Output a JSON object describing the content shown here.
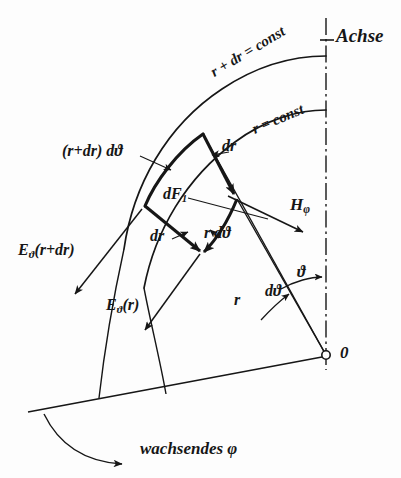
{
  "figure": {
    "kind": "hand-drawn technical diagram",
    "language": "German",
    "ink_color": "#161616",
    "background_color": "#fdfdfd"
  },
  "labels": {
    "axis": "Achse",
    "outer_arc": "r + dr = const",
    "inner_arc": "r = const",
    "outer_tangential_edge": "(r+dr) dϑ",
    "inner_tangential_edge": "r dϑ",
    "radial_edge_top": "dr",
    "radial_edge_bottom": "dr",
    "area_element": "dF",
    "area_element_subscript": "1",
    "field_outer": "E",
    "field_outer_subscript": "ϑ",
    "field_outer_arg": "(r+dr)",
    "field_inner": "E",
    "field_inner_subscript": "ϑ",
    "field_inner_arg": "(r)",
    "magnetic": "H",
    "magnetic_subscript": "φ",
    "radius": "r",
    "angle": "ϑ",
    "angle_increment": "dϑ",
    "origin": "0",
    "growing_phi": "wachsendes φ"
  },
  "geometry": {
    "origin_x": 326,
    "origin_y": 355,
    "inner_radius": 196,
    "outer_radius": 238,
    "element_corner_top": [
      203,
      134
    ],
    "element_corner_left": [
      145,
      206
    ],
    "element_corner_bottom": [
      203,
      253
    ],
    "element_corner_right": [
      237,
      199
    ]
  }
}
